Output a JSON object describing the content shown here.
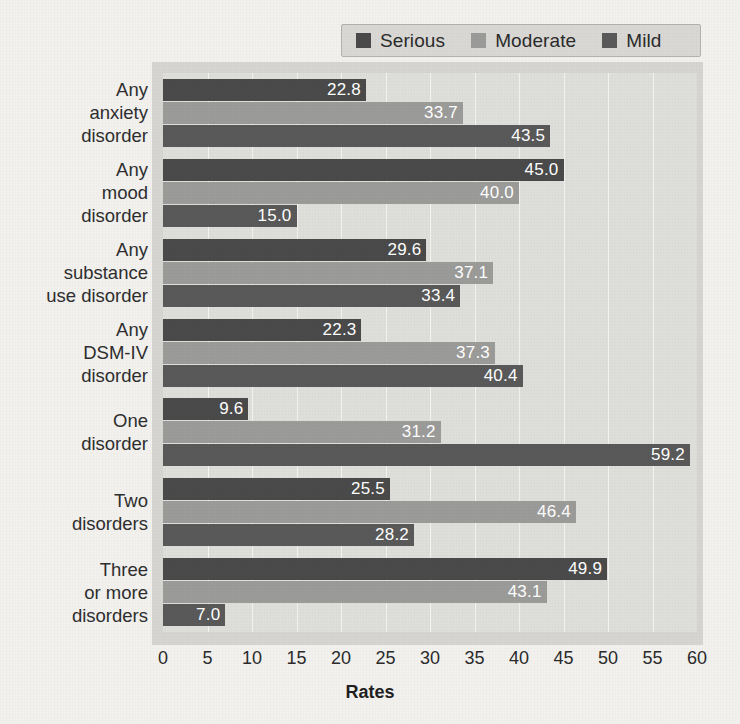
{
  "chart_data": {
    "type": "bar",
    "orientation": "horizontal",
    "title": "",
    "xlabel": "Rates",
    "ylabel": "",
    "xlim": [
      0,
      60
    ],
    "xticks": [
      0,
      5,
      10,
      15,
      20,
      25,
      30,
      35,
      40,
      45,
      50,
      55,
      60
    ],
    "grid": true,
    "legend_position": "top",
    "categories": [
      "Any anxiety disorder",
      "Any mood disorder",
      "Any substance use disorder",
      "Any DSM-IV disorder",
      "One disorder",
      "Two disorders",
      "Three or more disorders"
    ],
    "category_lines": [
      [
        "Any",
        "anxiety",
        "disorder"
      ],
      [
        "Any",
        "mood",
        "disorder"
      ],
      [
        "Any",
        "substance",
        "use disorder"
      ],
      [
        "Any",
        "DSM-IV",
        "disorder"
      ],
      [
        "One",
        "disorder"
      ],
      [
        "Two",
        "disorders"
      ],
      [
        "Three",
        "or more",
        "disorders"
      ]
    ],
    "series": [
      {
        "name": "Serious",
        "color": "#4a4a4a",
        "values": [
          22.8,
          45.0,
          29.6,
          22.3,
          9.6,
          25.5,
          49.9
        ],
        "labels": [
          "22.8",
          "45.0",
          "29.6",
          "22.3",
          "9.6",
          "25.5",
          "49.9"
        ]
      },
      {
        "name": "Moderate",
        "color": "#9b9b99",
        "values": [
          33.7,
          40.0,
          37.1,
          37.3,
          31.2,
          46.4,
          43.1
        ],
        "labels": [
          "33.7",
          "40.0",
          "37.1",
          "37.3",
          "31.2",
          "46.4",
          "43.1"
        ]
      },
      {
        "name": "Mild",
        "color": "#595959",
        "values": [
          43.5,
          15.0,
          33.4,
          40.4,
          59.2,
          28.2,
          7.0
        ],
        "labels": [
          "43.5",
          "15.0",
          "33.4",
          "40.4",
          "59.2",
          "28.2",
          "7.0"
        ]
      }
    ]
  },
  "legend": {
    "items": [
      {
        "label": "Serious",
        "color": "#4a4a4a"
      },
      {
        "label": "Moderate",
        "color": "#9b9b99"
      },
      {
        "label": "Mild",
        "color": "#595959"
      }
    ]
  },
  "axis": {
    "x_label": "Rates"
  }
}
